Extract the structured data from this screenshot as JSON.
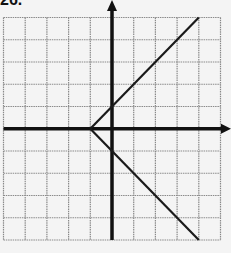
{
  "problem_label": "26.",
  "colors": {
    "grid": "#8a8a8a",
    "axis": "#111111",
    "curve": "#1a1a1a",
    "background": "#f4f4f4"
  },
  "chart_data": {
    "type": "line",
    "title": "26.",
    "grid": true,
    "xlim": [
      -5,
      5
    ],
    "ylim": [
      -5,
      5
    ],
    "xlabel": "",
    "ylabel": "",
    "axis_arrows": [
      "positive-x",
      "positive-y"
    ],
    "series": [
      {
        "name": "upper-branch",
        "points": [
          [
            -1,
            0
          ],
          [
            4,
            5
          ]
        ]
      },
      {
        "name": "lower-branch",
        "points": [
          [
            -1,
            0
          ],
          [
            4,
            -5
          ]
        ]
      }
    ],
    "vertex": [
      -1,
      0
    ]
  }
}
